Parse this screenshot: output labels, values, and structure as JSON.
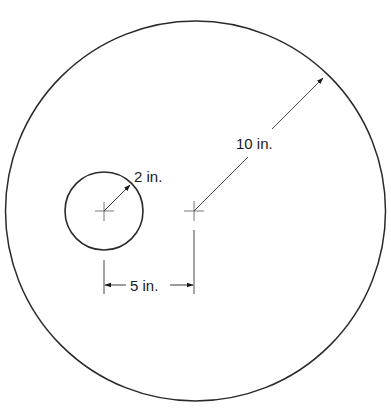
{
  "diagram": {
    "type": "geometry-figure",
    "colors": {
      "stroke": "#2a2a2a",
      "dimension_line": "#4a4a4a",
      "background": "#ffffff"
    },
    "large_circle": {
      "radius_label": "10 in."
    },
    "small_circle": {
      "radius_label": "2 in."
    },
    "center_distance": {
      "label": "5 in."
    }
  }
}
